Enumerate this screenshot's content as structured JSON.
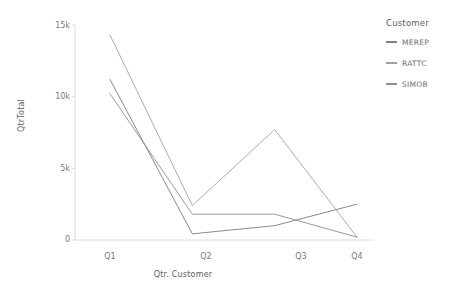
{
  "chart_data": {
    "type": "line",
    "title": "",
    "xlabel": "Qtr. Customer",
    "ylabel": "QtrTotal",
    "categories": [
      "Q1",
      "Q2",
      "Q3",
      "Q4"
    ],
    "x_tick_labels": [
      "Q1",
      "Q2",
      "Q3",
      "Q4"
    ],
    "y_tick_labels": [
      "0",
      "5k",
      "10k",
      "15k"
    ],
    "y_tick_values": [
      0,
      5000,
      10000,
      15000
    ],
    "ylim": [
      0,
      15000
    ],
    "grid": false,
    "legend_position": "right",
    "legend_title": "Customer",
    "series": [
      {
        "name": "MEREP",
        "color": "#7c7c8a",
        "values": [
          11200,
          430,
          1000,
          2500
        ]
      },
      {
        "name": "RATTC",
        "color": "#a0a0aa",
        "values": [
          14300,
          2400,
          7700,
          200
        ]
      },
      {
        "name": "SIMOB",
        "color": "#8d8d99",
        "values": [
          10200,
          1800,
          1800,
          200
        ]
      }
    ]
  },
  "axes": {
    "y_title": "QtrTotal",
    "x_title": "Qtr. Customer",
    "y_ticks": [
      {
        "label": "15k",
        "value": 15000
      },
      {
        "label": "10k",
        "value": 10000
      },
      {
        "label": "5k",
        "value": 5000
      },
      {
        "label": "0",
        "value": 0
      }
    ],
    "x_ticks": [
      {
        "label": "Q1"
      },
      {
        "label": "Q2"
      },
      {
        "label": "Q3"
      },
      {
        "label": "Q4"
      }
    ]
  },
  "legend": {
    "title": "Customer",
    "items": [
      {
        "label": "MEREP",
        "color": "#7c7c8a"
      },
      {
        "label": "RATTC",
        "color": "#a0a0aa"
      },
      {
        "label": "SIMOB",
        "color": "#8d8d99"
      }
    ]
  },
  "colors": {
    "axis_line": "#d8d8d8",
    "tick_text": "#7a7a7a",
    "title_text": "#5e5e5e",
    "background": "#ffffff"
  }
}
